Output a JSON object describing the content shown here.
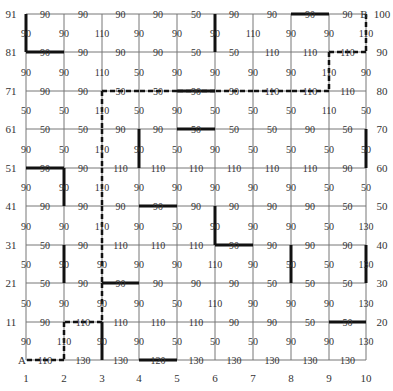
{
  "diagram": {
    "type": "grid-graph",
    "columns": 10,
    "rows": 10,
    "column_labels": [
      "1",
      "2",
      "3",
      "4",
      "5",
      "6",
      "7",
      "8",
      "9",
      "10"
    ],
    "left_row_labels": [
      "91",
      "81",
      "71",
      "61",
      "51",
      "41",
      "31",
      "21",
      "11",
      ""
    ],
    "right_row_labels": [
      "100",
      "90",
      "80",
      "70",
      "60",
      "50",
      "40",
      "30",
      "20",
      ""
    ],
    "start_label": "A",
    "end_label": "B",
    "horizontal_edges": [
      [
        "90",
        "90",
        "90",
        "90",
        "50",
        "90",
        "90",
        "90",
        "90"
      ],
      [
        "90",
        "90",
        "90",
        "90",
        "50",
        "50",
        "110",
        "110",
        "110"
      ],
      [
        "90",
        "90",
        "50",
        "50",
        "90",
        "90",
        "110",
        "110",
        "110"
      ],
      [
        "50",
        "50",
        "90",
        "90",
        "50",
        "50",
        "50",
        "90",
        "50"
      ],
      [
        "90",
        "90",
        "110",
        "110",
        "110",
        "110",
        "110",
        "110",
        "90"
      ],
      [
        "90",
        "90",
        "90",
        "90",
        "90",
        "90",
        "90",
        "90",
        "50"
      ],
      [
        "50",
        "90",
        "110",
        "110",
        "110",
        "90",
        "90",
        "90",
        "90"
      ],
      [
        "50",
        "90",
        "90",
        "90",
        "90",
        "90",
        "50",
        "50",
        "50"
      ],
      [
        "90",
        "110",
        "110",
        "110",
        "110",
        "90",
        "90",
        "50",
        "50"
      ],
      [
        "110",
        "130",
        "130",
        "120",
        "130",
        "130",
        "130",
        "130",
        "130"
      ]
    ],
    "vertical_edges": [
      [
        "90",
        "90",
        "110",
        "90",
        "90",
        "90",
        "110",
        "90",
        "90",
        "110"
      ],
      [
        "90",
        "90",
        "110",
        "50",
        "90",
        "90",
        "90",
        "90",
        "110",
        "90"
      ],
      [
        "50",
        "50",
        "110",
        "50",
        "90",
        "50",
        "50",
        "50",
        "110",
        "50"
      ],
      [
        "90",
        "50",
        "110",
        "90",
        "50",
        "90",
        "50",
        "50",
        "50",
        "50"
      ],
      [
        "90",
        "90",
        "110",
        "90",
        "90",
        "90",
        "90",
        "90",
        "50",
        "50"
      ],
      [
        "90",
        "90",
        "110",
        "90",
        "50",
        "90",
        "90",
        "90",
        "50",
        "130"
      ],
      [
        "50",
        "90",
        "90",
        "90",
        "90",
        "110",
        "90",
        "50",
        "50",
        "130"
      ],
      [
        "50",
        "90",
        "90",
        "90",
        "50",
        "110",
        "90",
        "90",
        "90",
        "130"
      ],
      [
        "90",
        "110",
        "90",
        "90",
        "50",
        "50",
        "50",
        "90",
        "90",
        "130"
      ]
    ],
    "bold_walls": [
      {
        "type": "v",
        "row": 0,
        "col": 0
      },
      {
        "type": "h",
        "row": 1,
        "col": 0
      },
      {
        "type": "v",
        "row": 0,
        "col": 5
      },
      {
        "type": "h",
        "row": 0,
        "col": 7
      },
      {
        "type": "h",
        "row": 2,
        "col": 4
      },
      {
        "type": "h",
        "row": 3,
        "col": 4
      },
      {
        "type": "v",
        "row": 3,
        "col": 3
      },
      {
        "type": "v",
        "row": 3,
        "col": 9
      },
      {
        "type": "h",
        "row": 4,
        "col": 0
      },
      {
        "type": "v",
        "row": 4,
        "col": 1
      },
      {
        "type": "h",
        "row": 5,
        "col": 3
      },
      {
        "type": "v",
        "row": 5,
        "col": 5
      },
      {
        "type": "h",
        "row": 6,
        "col": 5
      },
      {
        "type": "v",
        "row": 6,
        "col": 1
      },
      {
        "type": "v",
        "row": 6,
        "col": 7
      },
      {
        "type": "v",
        "row": 6,
        "col": 9
      },
      {
        "type": "h",
        "row": 7,
        "col": 2
      },
      {
        "type": "v",
        "row": 8,
        "col": 2
      },
      {
        "type": "h",
        "row": 9,
        "col": 3
      },
      {
        "type": "h",
        "row": 8,
        "col": 8
      }
    ],
    "path_dashed": [
      [
        0,
        9
      ],
      [
        1,
        9
      ],
      [
        1,
        8
      ],
      [
        2,
        8
      ],
      [
        2,
        7
      ],
      [
        2,
        6
      ],
      [
        2,
        5
      ],
      [
        2,
        4
      ],
      [
        2,
        3
      ],
      [
        2,
        2
      ],
      [
        3,
        2
      ],
      [
        4,
        2
      ],
      [
        5,
        2
      ],
      [
        6,
        2
      ],
      [
        7,
        2
      ],
      [
        8,
        2
      ],
      [
        8,
        1
      ],
      [
        9,
        1
      ],
      [
        9,
        0
      ]
    ],
    "colors": {
      "grid": "#777777",
      "wall": "#111111",
      "path": "#111111",
      "text": "#333333"
    }
  }
}
